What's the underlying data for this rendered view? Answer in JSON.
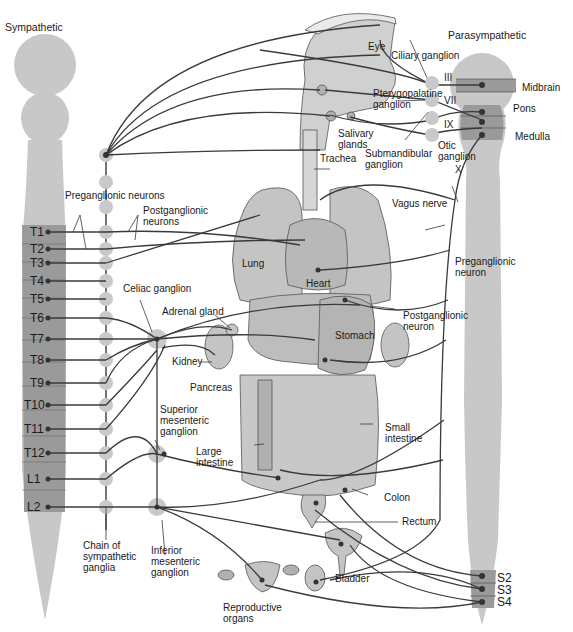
{
  "titles": {
    "sympathetic": "Sympathetic",
    "parasympathetic": "Parasympathetic"
  },
  "sympathetic_segments": [
    "T1",
    "T2",
    "T3",
    "T4",
    "T5",
    "T6",
    "T7",
    "T8",
    "T9",
    "T10",
    "T11",
    "T12",
    "L1",
    "L2"
  ],
  "parasympathetic_brain": {
    "cranial_nerves": [
      "III",
      "VII",
      "IX",
      "X"
    ],
    "regions": [
      "Midbrain",
      "Pons",
      "Medulla"
    ]
  },
  "parasympathetic_sacral": [
    "S2",
    "S3",
    "S4"
  ],
  "labels": {
    "preganglionic_neurons": "Preganglionic neurons",
    "postganglionic_neurons_1": "Postganglionic",
    "postganglionic_neurons_2": "neurons",
    "celiac_ganglion": "Celiac ganglion",
    "adrenal_gland": "Adrenal gland",
    "kidney": "Kidney",
    "pancreas": "Pancreas",
    "superior_mesenteric_1": "Superior",
    "superior_mesenteric_2": "mesenteric",
    "superior_mesenteric_3": "ganglion",
    "inferior_mesenteric_1": "Inferior",
    "inferior_mesenteric_2": "mesenteric",
    "inferior_mesenteric_3": "ganglion",
    "chain_1": "Chain of",
    "chain_2": "sympathetic",
    "chain_3": "ganglia",
    "large_intestine_1": "Large",
    "large_intestine_2": "intestine",
    "eye": "Eye",
    "ciliary_ganglion": "Ciliary ganglion",
    "pterygopalatine_1": "Pterygopalatine",
    "pterygopalatine_2": "ganglion",
    "salivary_1": "Salivary",
    "salivary_2": "glands",
    "trachea": "Trachea",
    "submandibular_1": "Submandibular",
    "submandibular_2": "ganglion",
    "otic_1": "Otic",
    "otic_2": "ganglion",
    "vagus_nerve": "Vagus nerve",
    "lung": "Lung",
    "heart": "Heart",
    "preganglionic_neuron_1": "Preganglionic",
    "preganglionic_neuron_2": "neuron",
    "postganglionic_neuron_1": "Postganglionic",
    "postganglionic_neuron_2": "neuron",
    "stomach": "Stomach",
    "small_intestine_1": "Small",
    "small_intestine_2": "intestine",
    "colon": "Colon",
    "rectum": "Rectum",
    "bladder": "Bladder",
    "reproductive_1": "Reproductive",
    "reproductive_2": "organs"
  },
  "colors": {
    "cord_light": "#c8c8c8",
    "cord_dark": "#9a9a9a",
    "organ_fill": "#c4c4c4",
    "organ_stroke": "#555555",
    "nerve": "#3a3a3a",
    "ganglion": "#c9c9c9"
  }
}
